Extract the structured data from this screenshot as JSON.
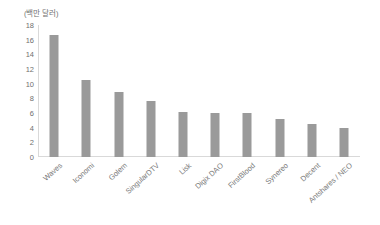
{
  "chart_data": {
    "type": "bar",
    "title": "",
    "subtitle": "",
    "xlabel": "",
    "ylabel": "",
    "unit_caption": "(백만 달러)",
    "categories": [
      "Waves",
      "Iconomi",
      "Golem",
      "SingularDTV",
      "Lisk",
      "Digix DAO",
      "FirstBlood",
      "Synereo",
      "Decent",
      "Antshares / NEO"
    ],
    "values": [
      16.7,
      10.5,
      8.9,
      7.6,
      6.1,
      6.0,
      6.0,
      5.2,
      4.5,
      4.0
    ],
    "ylim": [
      0,
      18
    ],
    "ytick_step": 2,
    "yticks": [
      0,
      2,
      4,
      6,
      8,
      10,
      12,
      14,
      16,
      18
    ],
    "ytick_labels": [
      "0",
      "2",
      "4",
      "6",
      "8",
      "10",
      "12",
      "14",
      "16",
      "18"
    ],
    "grid": false,
    "legend": null,
    "legend_position": "none",
    "bar_color": "#9a9a9a",
    "axis_color": "#d9d9d9",
    "text_color": "#6f6f6f",
    "label_color": "#7a7a7a",
    "background_color": "#ffffff",
    "label_rotation_deg": -42
  }
}
